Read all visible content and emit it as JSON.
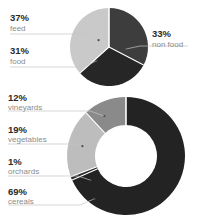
{
  "chart_data": [
    {
      "type": "pie",
      "title": "",
      "subtitle": "",
      "xlabel": "",
      "ylabel": "",
      "grid": false,
      "legend_position": "callout-labels",
      "center": [
        109,
        47
      ],
      "radius": 39,
      "categories": [
        "feed",
        "non food",
        "food"
      ],
      "values": [
        37,
        33,
        31
      ],
      "value_labels": [
        "37%",
        "33%",
        "31%"
      ],
      "colors": [
        "#c9c9c9",
        "#3d3d3d",
        "#262626"
      ],
      "slices": [
        {
          "label": "feed",
          "value": 37,
          "value_label": "37%",
          "color": "#c9c9c9",
          "label_side": "left"
        },
        {
          "label": "non food",
          "value": 33,
          "value_label": "33%",
          "color": "#3d3d3d",
          "label_side": "right"
        },
        {
          "label": "food",
          "value": 31,
          "value_label": "31%",
          "color": "#262626",
          "label_side": "left"
        }
      ]
    },
    {
      "type": "pie",
      "title": "",
      "subtitle": "",
      "xlabel": "",
      "ylabel": "",
      "grid": false,
      "legend_position": "callout-labels",
      "donut": true,
      "center": [
        126,
        156
      ],
      "radius": 59,
      "inner_radius": 31,
      "categories": [
        "cereals",
        "vineyards",
        "vegetables",
        "orchards"
      ],
      "values": [
        69,
        12,
        19,
        1
      ],
      "value_labels": [
        "69%",
        "12%",
        "19%",
        "1%"
      ],
      "colors": [
        "#232323",
        "#8a8a8a",
        "#bdbdbd",
        "#2a2a2a"
      ],
      "slices": [
        {
          "label": "cereals",
          "value": 69,
          "value_label": "69%",
          "color": "#232323",
          "label_side": "left"
        },
        {
          "label": "vineyards",
          "value": 12,
          "value_label": "12%",
          "color": "#8a8a8a",
          "label_side": "left"
        },
        {
          "label": "vegetables",
          "value": 19,
          "value_label": "19%",
          "color": "#bdbdbd",
          "label_side": "left"
        },
        {
          "label": "orchards",
          "value": 1,
          "value_label": "1%",
          "color": "#2a2a2a",
          "label_side": "left"
        }
      ]
    }
  ],
  "pie_chart": {
    "labels": {
      "feed": {
        "pct": "37%",
        "name": "feed"
      },
      "non_food": {
        "pct": "33%",
        "name": "non food"
      },
      "food": {
        "pct": "31%",
        "name": "food"
      }
    }
  },
  "donut_chart": {
    "labels": {
      "vineyards": {
        "pct": "12%",
        "name": "vineyards"
      },
      "vegetables": {
        "pct": "19%",
        "name": "vegetables"
      },
      "orchards": {
        "pct": "1%",
        "name": "orchards"
      },
      "cereals": {
        "pct": "69%",
        "name": "cereals"
      }
    }
  }
}
